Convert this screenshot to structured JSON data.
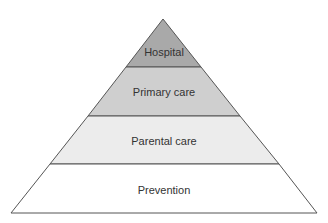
{
  "diagram": {
    "type": "pyramid",
    "levels": [
      {
        "label": "Hospital",
        "fill": "#a9a9a9"
      },
      {
        "label": "Primary care",
        "fill": "#cfcfcf"
      },
      {
        "label": "Parental care",
        "fill": "#ececec"
      },
      {
        "label": "Prevention",
        "fill": "#ffffff"
      }
    ],
    "outline_color": "#555555"
  }
}
